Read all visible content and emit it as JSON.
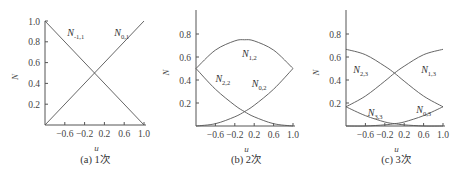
{
  "chart_data": [
    {
      "type": "line",
      "panel": "a",
      "caption": "(a) 1次",
      "xlabel": "u",
      "ylabel": "N",
      "xlim": [
        -1.0,
        1.0
      ],
      "ylim": [
        0,
        1.0
      ],
      "xticks": [
        "-0.6",
        "-0.2",
        "0.2",
        "0.6",
        "1.0"
      ],
      "yticks": [
        "0.2",
        "0.4",
        "0.6",
        "0.8",
        "1.0"
      ],
      "grid": false,
      "series": [
        {
          "name": "N_{-1,1}",
          "label_main": "N",
          "label_sub": "-1,1",
          "x": [
            -1.0,
            1.0
          ],
          "y": [
            1.0,
            0.0
          ]
        },
        {
          "name": "N_{0,1}",
          "label_main": "N",
          "label_sub": "0,1",
          "x": [
            -1.0,
            1.0
          ],
          "y": [
            0.0,
            1.0
          ]
        }
      ]
    },
    {
      "type": "line",
      "panel": "b",
      "caption": "(b) 2次",
      "xlabel": "u",
      "ylabel": "N",
      "xlim": [
        -1.0,
        1.0
      ],
      "ylim": [
        0,
        1.0
      ],
      "xticks": [
        "-0.6",
        "-0.2",
        "0.2",
        "0.6",
        "1.0"
      ],
      "yticks": [
        "0.2",
        "0.4",
        "0.6",
        "0.8"
      ],
      "grid": false,
      "series": [
        {
          "name": "N_{1,2}",
          "label_main": "N",
          "label_sub": "1,2",
          "x": [
            -1.0,
            -0.6,
            -0.2,
            0.0,
            0.2,
            0.6,
            1.0
          ],
          "y": [
            0.5,
            0.66,
            0.74,
            0.75,
            0.74,
            0.66,
            0.5
          ]
        },
        {
          "name": "N_{2,2}",
          "label_main": "N",
          "label_sub": "2,2",
          "x": [
            -1.0,
            -0.6,
            -0.2,
            0.0,
            0.2,
            0.6,
            1.0
          ],
          "y": [
            0.5,
            0.32,
            0.18,
            0.125,
            0.08,
            0.02,
            0.0
          ]
        },
        {
          "name": "N_{0,2}",
          "label_main": "N",
          "label_sub": "0,2",
          "x": [
            -1.0,
            -0.6,
            -0.2,
            0.0,
            0.2,
            0.6,
            1.0
          ],
          "y": [
            0.0,
            0.02,
            0.08,
            0.125,
            0.18,
            0.32,
            0.5
          ]
        }
      ]
    },
    {
      "type": "line",
      "panel": "c",
      "caption": "(c) 3次",
      "xlabel": "u",
      "ylabel": "N",
      "xlim": [
        -1.0,
        1.0
      ],
      "ylim": [
        0,
        1.0
      ],
      "xticks": [
        "-0.6",
        "-0.2",
        "0.2",
        "0.6",
        "1.0"
      ],
      "yticks": [
        "0.2",
        "0.4",
        "0.6",
        "0.8"
      ],
      "grid": false,
      "series": [
        {
          "name": "N_{2,3}",
          "label_main": "N",
          "label_sub": "2,3",
          "x": [
            -1.0,
            -0.6,
            -0.2,
            0.0,
            0.2,
            0.6,
            1.0
          ],
          "y": [
            0.667,
            0.62,
            0.52,
            0.46,
            0.39,
            0.26,
            0.167
          ]
        },
        {
          "name": "N_{1,3}",
          "label_main": "N",
          "label_sub": "1,3",
          "x": [
            -1.0,
            -0.6,
            -0.2,
            0.0,
            0.2,
            0.6,
            1.0
          ],
          "y": [
            0.167,
            0.26,
            0.39,
            0.46,
            0.52,
            0.62,
            0.667
          ]
        },
        {
          "name": "N_{3,3}",
          "label_main": "N",
          "label_sub": "3,3",
          "x": [
            -1.0,
            -0.6,
            -0.2,
            0.0,
            0.2,
            0.6,
            1.0
          ],
          "y": [
            0.167,
            0.09,
            0.035,
            0.02,
            0.01,
            0.0,
            0.0
          ]
        },
        {
          "name": "N_{0,3}",
          "label_main": "N",
          "label_sub": "0,3",
          "x": [
            -1.0,
            -0.6,
            -0.2,
            0.0,
            0.2,
            0.6,
            1.0
          ],
          "y": [
            0.0,
            0.0,
            0.01,
            0.02,
            0.035,
            0.09,
            0.167
          ]
        }
      ]
    }
  ]
}
